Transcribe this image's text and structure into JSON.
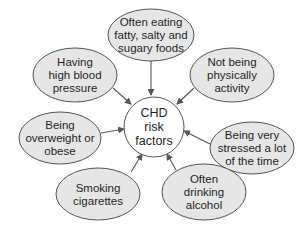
{
  "center": {
    "lines": [
      "CHD",
      "risk",
      "factors"
    ],
    "cx": 154,
    "cy": 127,
    "r": 30,
    "fill": "#ffffff"
  },
  "colors": {
    "bubble_fill": "#e6e6e6",
    "stroke": "#555555",
    "arrow": "#555555",
    "text": "#1f1f1f"
  },
  "factors": [
    {
      "id": "diet",
      "lines": [
        "Often eating",
        "fatty, salty and",
        "sugary foods"
      ],
      "cx": 151,
      "cy": 35,
      "rx": 43,
      "ry": 26,
      "arrow": [
        151,
        61,
        151,
        95
      ]
    },
    {
      "id": "blood-pressure",
      "lines": [
        "Having",
        "high blood",
        "pressure"
      ],
      "cx": 75,
      "cy": 75,
      "rx": 42,
      "ry": 27,
      "arrow": [
        113,
        88,
        131,
        104
      ]
    },
    {
      "id": "inactivity",
      "lines": [
        "Not being",
        "physically",
        "activity"
      ],
      "cx": 232,
      "cy": 75,
      "rx": 42,
      "ry": 27,
      "arrow": [
        194,
        88,
        177,
        104
      ]
    },
    {
      "id": "overweight",
      "lines": [
        "Being",
        "overweight or",
        "obese"
      ],
      "cx": 60,
      "cy": 138,
      "rx": 41,
      "ry": 26,
      "arrow": [
        101,
        133,
        124,
        129
      ]
    },
    {
      "id": "stress",
      "lines": [
        "Being very",
        "stressed a lot",
        "of the time"
      ],
      "cx": 252,
      "cy": 148,
      "rx": 42,
      "ry": 26,
      "arrow": [
        210,
        144,
        184,
        131
      ]
    },
    {
      "id": "smoking",
      "lines": [
        "Smoking",
        "cigarettes"
      ],
      "cx": 98,
      "cy": 194,
      "rx": 42,
      "ry": 26,
      "arrow": [
        131,
        172,
        142,
        154
      ]
    },
    {
      "id": "alcohol",
      "lines": [
        "Often",
        "drinking",
        "alcohol"
      ],
      "cx": 204,
      "cy": 192,
      "rx": 42,
      "ry": 28,
      "arrow": [
        176,
        170,
        167,
        154
      ]
    }
  ]
}
